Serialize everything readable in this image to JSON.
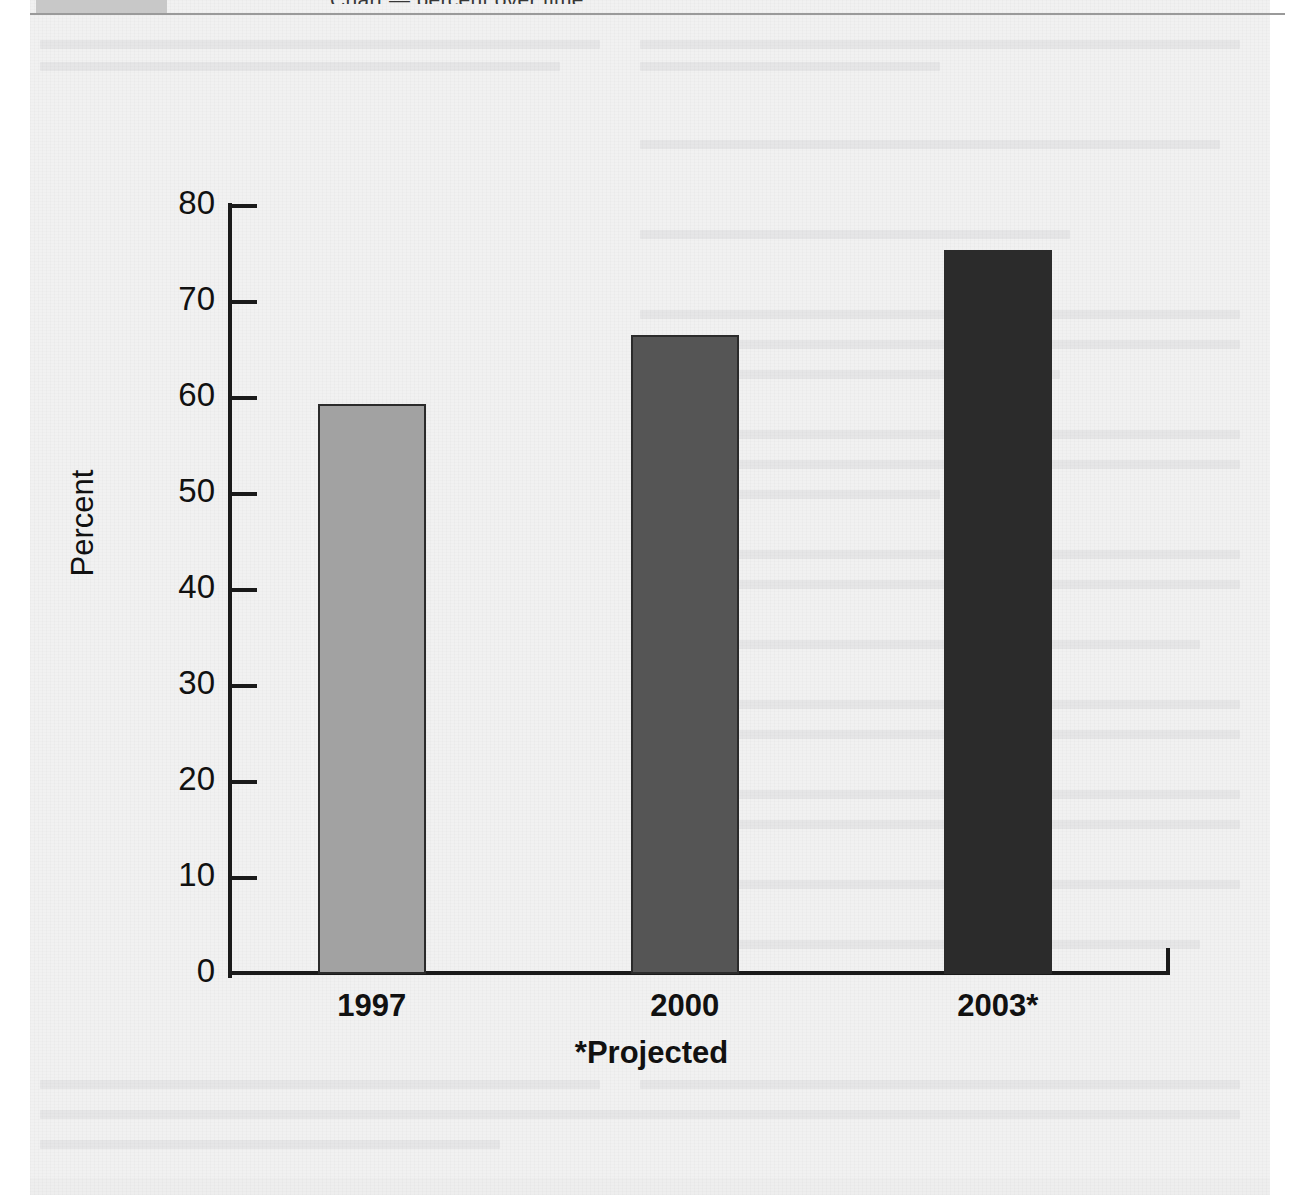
{
  "page": {
    "header_title": "Chart — percent over time",
    "background_color": "#f1f1f1",
    "paper_margin_color": "#ffffff",
    "header_swatch_color": "#c8c8c8",
    "header_rule_color": "#9a9a9a"
  },
  "chart_data": {
    "type": "bar",
    "title": "",
    "subtitle": "",
    "xlabel": "",
    "ylabel": "Percent",
    "categories": [
      "1997",
      "2000",
      "2003*"
    ],
    "values": [
      59.4,
      66.6,
      75.4
    ],
    "ylim": [
      0,
      80
    ],
    "ytick_labels": [
      "80",
      "70",
      "60",
      "50",
      "40",
      "30",
      "20",
      "10",
      "0"
    ],
    "ytick_values": [
      80,
      70,
      60,
      50,
      40,
      30,
      20,
      10,
      0
    ],
    "ytick_step": 10,
    "grid": false,
    "legend": false,
    "legend_position": "none",
    "annotations": [
      "*Projected"
    ],
    "footnote": "*Projected",
    "bar_colors": [
      "#a2a2a2",
      "#555555",
      "#2b2b2b"
    ],
    "bar_border_color": "#2b2b2b",
    "axis_color": "#1a1a1a",
    "series": [
      {
        "name": "Percent",
        "points": [
          {
            "category": "1997",
            "value": 59.4,
            "color": "#a2a2a2"
          },
          {
            "category": "2000",
            "value": 66.6,
            "color": "#555555"
          },
          {
            "category": "2003*",
            "value": 75.4,
            "color": "#2b2b2b"
          }
        ]
      }
    ]
  }
}
